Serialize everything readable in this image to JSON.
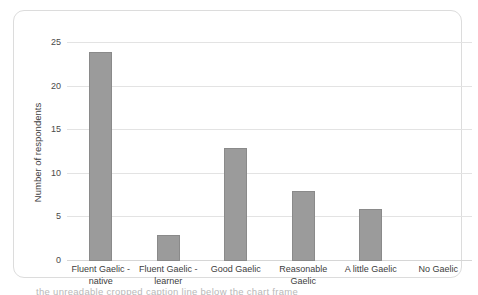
{
  "chart_data": {
    "type": "bar",
    "title": "",
    "subtitle": "",
    "xlabel": "",
    "ylabel": "Number of respondents",
    "categories": [
      "Fluent Gaelic - native",
      "Fluent Gaelic - learner",
      "Good Gaelic",
      "Reasonable Gaelic",
      "A little Gaelic",
      "No Gaelic"
    ],
    "category_lines": [
      [
        "Fluent Gaelic -",
        "native"
      ],
      [
        "Fluent Gaelic -",
        "learner"
      ],
      [
        "Good Gaelic"
      ],
      [
        "Reasonable",
        "Gaelic"
      ],
      [
        "A little Gaelic"
      ],
      [
        "No Gaelic"
      ]
    ],
    "values": [
      24,
      3,
      13,
      8,
      6,
      0
    ],
    "ylim": [
      0,
      25
    ],
    "yticks": [
      0,
      5,
      10,
      15,
      20,
      25
    ],
    "ytick_labels": [
      "0",
      "5",
      "10",
      "15",
      "20",
      "25"
    ],
    "grid": true,
    "grid_axis": "y",
    "legend": false,
    "legend_position": "none",
    "bar_color": "#9b9b9b",
    "bar_border_color": "#8a8a8a",
    "gridline_color": "#e3e3e3",
    "frame_color": "#dcdcdc",
    "background_color": "#ffffff",
    "text_color": "#3d3d3d"
  },
  "caption": {
    "cut_off_line": "a partially visible line of caption text cropped at the bottom edge"
  }
}
